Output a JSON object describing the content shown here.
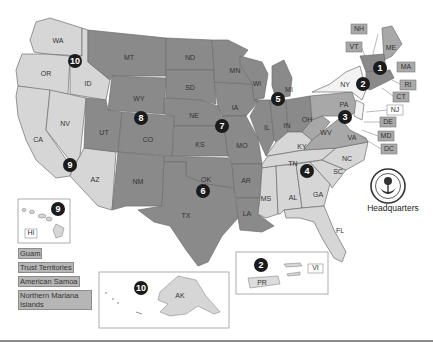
{
  "map": {
    "title": "EPA Regions",
    "colors": {
      "dark": "#8a8a8a",
      "mid": "#a8a8a8",
      "light": "#d6d6d6",
      "white": "#f3f3f3",
      "marker": "#1b1b1b"
    },
    "states": {
      "WA": "WA",
      "OR": "OR",
      "ID": "ID",
      "CA": "CA",
      "NV": "NV",
      "AZ": "AZ",
      "UT": "UT",
      "MT": "MT",
      "WY": "WY",
      "CO": "CO",
      "ND": "ND",
      "SD": "SD",
      "NE": "NE",
      "KS": "KS",
      "NM": "NM",
      "TX": "TX",
      "OK": "OK",
      "MN": "MN",
      "IA": "IA",
      "MO": "MO",
      "AR": "AR",
      "LA": "LA",
      "WI": "WI",
      "IL": "IL",
      "MI": "MI",
      "IN": "IN",
      "OH": "OH",
      "KY": "KY",
      "TN": "TN",
      "MS": "MS",
      "AL": "AL",
      "GA": "GA",
      "FL": "FL",
      "SC": "SC",
      "NC": "NC",
      "VA": "VA",
      "WV": "WV",
      "PA": "PA",
      "NY": "NY",
      "ME": "ME"
    },
    "callouts": {
      "NH": "NH",
      "VT": "VT",
      "MA": "MA",
      "RI": "RI",
      "CT": "CT",
      "NJ": "NJ",
      "DE": "DE",
      "MD": "MD",
      "DC": "DC"
    },
    "regions": {
      "r1": "1",
      "r2": "2",
      "r3": "3",
      "r4": "4",
      "r5": "5",
      "r6": "6",
      "r7": "7",
      "r8": "8",
      "r9": "9",
      "r10": "10"
    },
    "insets": {
      "hawaii": {
        "label": "HI",
        "region": "9"
      },
      "alaska": {
        "label": "AK",
        "region": "10"
      },
      "caribbean": {
        "pr": "PR",
        "vi": "VI",
        "region": "2"
      }
    },
    "territories": [
      "Guam",
      "Trust Territories",
      "American Samoa",
      "Northern Mariana Islands"
    ],
    "headquarters": "Headquarters"
  }
}
